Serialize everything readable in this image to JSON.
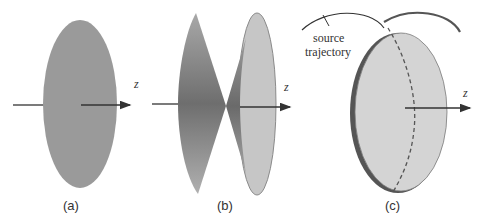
{
  "figure": {
    "panels": [
      {
        "id": "a",
        "caption": "(a)",
        "axis_label": "z",
        "shape": "flat disc"
      },
      {
        "id": "b",
        "caption": "(b)",
        "axis_label": "z",
        "shape": "double cone with disc"
      },
      {
        "id": "c",
        "caption": "(c)",
        "axis_label": "z",
        "shape": "disc with circular source trajectory",
        "annotation_line1": "source",
        "annotation_line2": "trajectory"
      }
    ],
    "colors": {
      "disc_a": "#9a9a9a",
      "cone_dark": "#7a7a7a",
      "disc_light": "#c8c8c8",
      "disc_c": "#d4d4d4",
      "line": "#333333"
    }
  }
}
